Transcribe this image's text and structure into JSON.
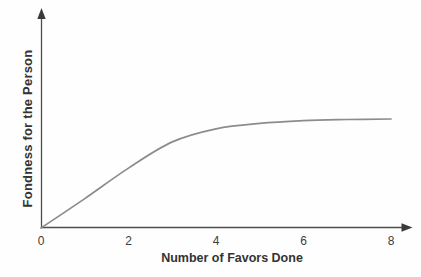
{
  "figure": {
    "background": "#fefefe"
  },
  "chart_data": {
    "type": "line",
    "title": "",
    "xlabel": "Number of Favors Done",
    "ylabel": "Fondness for the Person",
    "x_ticks": [
      "0",
      "2",
      "4",
      "6",
      "8"
    ],
    "y_ticks": [],
    "series": [
      {
        "name": "fondness-curve",
        "x": [
          0,
          1,
          2,
          3,
          4,
          5,
          6,
          7,
          8
        ],
        "y": [
          0,
          0.27,
          0.55,
          0.79,
          0.91,
          0.96,
          0.985,
          0.995,
          1.0
        ]
      }
    ],
    "xlim": [
      0,
      8.5
    ],
    "ylim": [
      0,
      2
    ],
    "grid": false,
    "legend": "none",
    "axes_style": "arrow-tipped",
    "colors": {
      "axis": "#4d4d4d",
      "arrow": "#3a3a3a",
      "curve": "#8c8c8c",
      "title_text": "#333333",
      "tick_text": "#3d3d3d"
    }
  }
}
